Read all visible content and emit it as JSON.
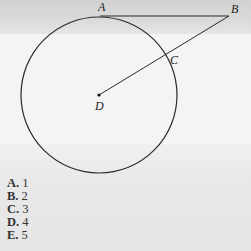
{
  "figure": {
    "points": {
      "A": {
        "label": "A",
        "x": 100,
        "y": 16
      },
      "B": {
        "label": "B",
        "x": 229,
        "y": 16
      },
      "C": {
        "label": "C",
        "x": 163,
        "y": 58
      },
      "D": {
        "label": "D",
        "x": 99,
        "y": 95
      }
    },
    "circle": {
      "center": "D",
      "radius": 78
    },
    "segments": [
      "AB",
      "DB"
    ]
  },
  "choices": [
    {
      "letter": "A.",
      "value": "1"
    },
    {
      "letter": "B.",
      "value": "2"
    },
    {
      "letter": "C.",
      "value": "3"
    },
    {
      "letter": "D.",
      "value": "4"
    },
    {
      "letter": "E.",
      "value": "5"
    }
  ]
}
